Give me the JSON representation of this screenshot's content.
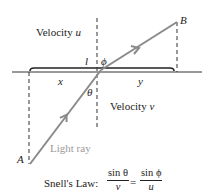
{
  "diagram": {
    "labels": {
      "velocity_upper": "Velocity",
      "velocity_upper_var": "u",
      "velocity_lower": "Velocity",
      "velocity_lower_var": "v",
      "point_a": "A",
      "point_b": "B",
      "segment_l": "l",
      "segment_x": "x",
      "segment_y": "y",
      "angle_theta": "θ",
      "angle_phi": "ϕ",
      "light_ray": "Light ray"
    },
    "formula": {
      "prefix": "Snell's Law:",
      "left_num": "sin θ",
      "left_den": "v",
      "equals": "=",
      "right_num": "sin ϕ",
      "right_den": "u"
    },
    "colors": {
      "ray": "#8a8a8a",
      "lines": "#222222",
      "ray_label": "#9a9a9a"
    }
  }
}
